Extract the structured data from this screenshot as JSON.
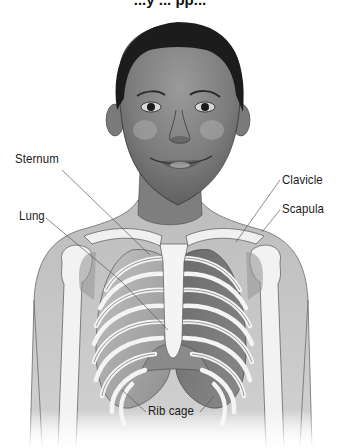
{
  "figure": {
    "title_cropped": "...y ... pp...",
    "labels": [
      {
        "id": "sternum",
        "text": "Sternum",
        "x": 15,
        "y": 151,
        "line": [
          [
            62,
            170
          ],
          [
            150,
            255
          ]
        ]
      },
      {
        "id": "lung",
        "text": "Lung",
        "x": 19,
        "y": 208,
        "line": [
          [
            46,
            218
          ],
          [
            120,
            280
          ],
          [
            168,
            330
          ]
        ]
      },
      {
        "id": "clavicle",
        "text": "Clavicle",
        "x": 282,
        "y": 172,
        "line": [
          [
            280,
            180
          ],
          [
            236,
            242
          ]
        ]
      },
      {
        "id": "scapula",
        "text": "Scapula",
        "x": 282,
        "y": 201,
        "line": [
          [
            280,
            210
          ],
          [
            262,
            232
          ]
        ]
      },
      {
        "id": "rib_cage",
        "text": "Rib cage",
        "x": 148,
        "y": 403,
        "lines": [
          [
            [
              146,
              412
            ],
            [
              122,
              390
            ]
          ],
          [
            [
              200,
              412
            ],
            [
              214,
              396
            ]
          ]
        ]
      }
    ]
  },
  "colors": {
    "background": "#ffffff",
    "skin_shade": "#8a8a8a",
    "hair": "#1c1c1c",
    "bone": "#f2f2f2",
    "lung_left": "#a8a8a8",
    "lung_right": "#7a7a7a",
    "leader_line": "#5a5a5a"
  }
}
